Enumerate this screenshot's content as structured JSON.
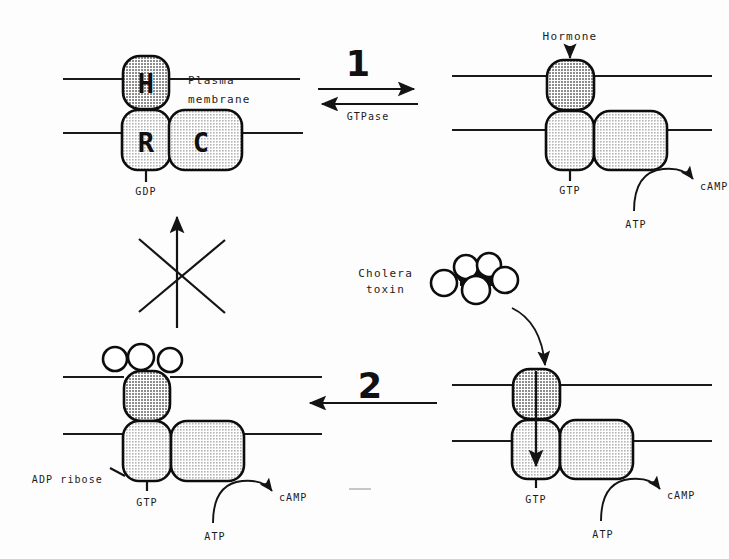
{
  "figure": {
    "width": 729,
    "height": 559,
    "background": "#fdfdfd",
    "ink_color": "#141414",
    "shade_dark": "#999999",
    "shade_light": "#c9c9c9"
  },
  "labels": {
    "plasma_membrane_line1": "Plasma",
    "plasma_membrane_line2": "membrane",
    "cholera_line1": "Cholera",
    "cholera_line2": "toxin",
    "hormone": "Hormone",
    "gtpase": "GTPase",
    "step_one": "1",
    "step_two": "2",
    "adp_ribose": "ADP ribose"
  },
  "panels": {
    "top_left": {
      "name": "inactive-receptor-complex",
      "subunits": [
        {
          "letter": "H",
          "name": "hormone-receptor-subunit",
          "shade": "#999999"
        },
        {
          "letter": "R",
          "name": "regulatory-g-protein-subunit",
          "shade": "#c9c9c9"
        },
        {
          "letter": "C",
          "name": "catalytic-adenylate-cyclase-subunit",
          "shade": "#c9c9c9"
        }
      ],
      "nucleotide": "GDP"
    },
    "top_right": {
      "name": "activated-receptor-complex",
      "stimulus": "Hormone",
      "nucleotide": "GTP",
      "substrate": "ATP",
      "product": "cAMP"
    },
    "bottom_right": {
      "name": "toxin-bound-complex",
      "nucleotide": "GTP",
      "substrate": "ATP",
      "product": "cAMP"
    },
    "bottom_left": {
      "name": "adp-ribosylated-complex",
      "modification": "ADP ribose",
      "nucleotide": "GTP",
      "substrate": "ATP",
      "product": "cAMP",
      "toxin_subunit_count": 3
    }
  },
  "toxin": {
    "name": "cholera-toxin-molecule",
    "outer_subunit_count": 5,
    "core_filled": true
  }
}
